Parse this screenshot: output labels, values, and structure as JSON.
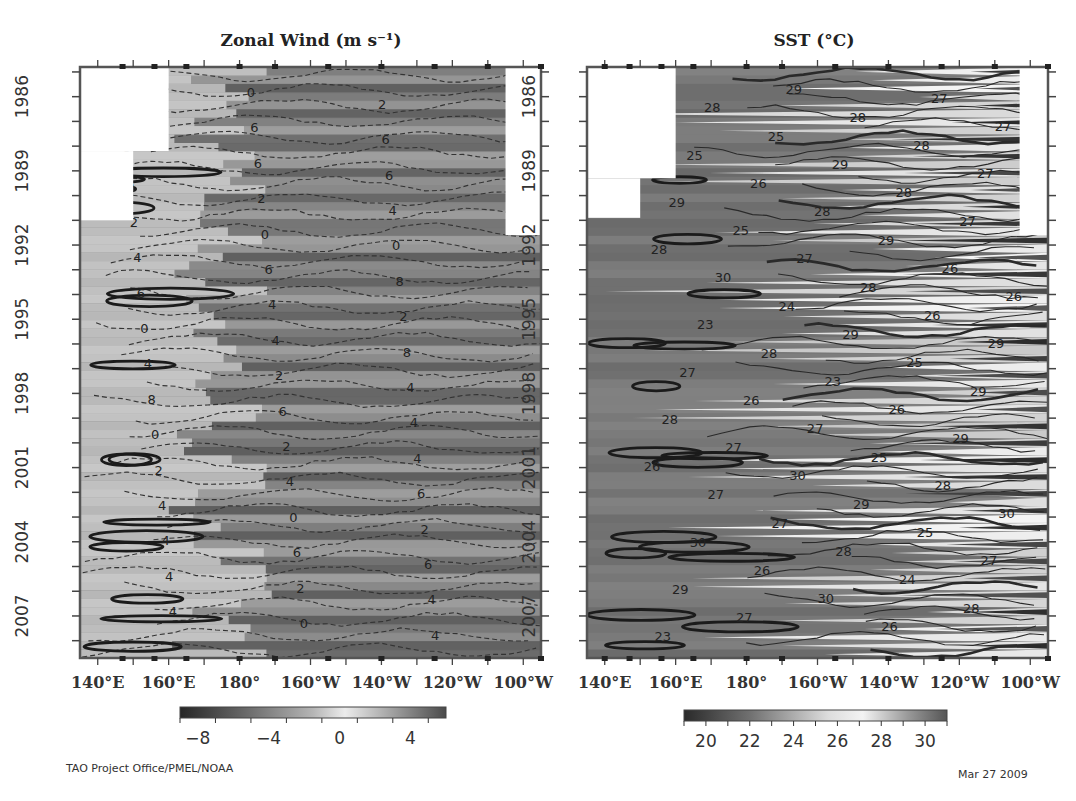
{
  "chart_data": [
    {
      "type": "heatmap",
      "title": "Zonal Wind (m s⁻¹)",
      "xlabel": "",
      "ylabel": "",
      "x_tick_labels": [
        "140°E",
        "160°E",
        "180°",
        "160°W",
        "140°W",
        "120°W",
        "100°W"
      ],
      "x_range_deg_east": [
        135,
        265
      ],
      "y_tick_labels": [
        "1986",
        "1989",
        "1992",
        "1995",
        "1998",
        "2001",
        "2004",
        "2007"
      ],
      "y_range_years": [
        1985.3,
        2009.2
      ],
      "y_direction": "increasing-downward",
      "colorbar": {
        "ticks": [
          "-8",
          "-4",
          "0",
          "4"
        ],
        "range": [
          -9,
          6
        ],
        "colormap": "grayscale (dark = strong easterly, light = weak/westerly)"
      },
      "contour_levels": [
        -8,
        -6,
        -4,
        -2,
        0,
        2,
        4
      ],
      "contour_labels_visible": [
        "4",
        "0",
        "2",
        "4",
        "6",
        "6",
        "8",
        "6",
        "6",
        "0",
        "2",
        "4",
        "2",
        "0",
        "0",
        "4",
        "6",
        "8",
        "6",
        "4",
        "2",
        "0",
        "4",
        "8",
        "4",
        "2",
        "4",
        "8",
        "6",
        "4",
        "0",
        "2",
        "4",
        "2",
        "4",
        "6",
        "4",
        "0",
        "2",
        "4",
        "6",
        "6",
        "4",
        "2",
        "4",
        "4",
        "0",
        "4"
      ],
      "missing_data_regions": [
        {
          "lon": [
            135,
            160
          ],
          "years": [
            1985.3,
            1988.7
          ]
        },
        {
          "lon": [
            135,
            150
          ],
          "years": [
            1988.7,
            1991.5
          ]
        },
        {
          "lon": [
            255,
            265
          ],
          "years": [
            1985.3,
            1992.1
          ]
        }
      ],
      "mooring_markers_lon": [
        147,
        156,
        165,
        180,
        190,
        205,
        220,
        235,
        250,
        265
      ]
    },
    {
      "type": "heatmap",
      "title": "SST (°C)",
      "xlabel": "",
      "ylabel": "",
      "x_tick_labels": [
        "140°E",
        "160°E",
        "180°",
        "160°W",
        "140°W",
        "120°W",
        "100°W"
      ],
      "x_range_deg_east": [
        135,
        265
      ],
      "y_tick_labels": [
        "1986",
        "1989",
        "1992",
        "1995",
        "1998",
        "2001",
        "2004",
        "2007"
      ],
      "y_range_years": [
        1985.3,
        2009.2
      ],
      "y_direction": "increasing-downward",
      "colorbar": {
        "ticks": [
          "20",
          "22",
          "24",
          "26",
          "28",
          "30"
        ],
        "range": [
          19,
          31
        ],
        "colormap": "grayscale (dark = cold/very warm extremes, light = mid)"
      },
      "contour_levels": [
        23,
        24,
        25,
        26,
        27,
        28,
        29,
        30
      ],
      "contour_labels_visible": [
        "28",
        "29",
        "27",
        "28",
        "28",
        "27",
        "25",
        "28",
        "25",
        "29",
        "27",
        "26",
        "28",
        "29",
        "28",
        "27",
        "25",
        "29",
        "28",
        "27",
        "26",
        "30",
        "28",
        "26",
        "24",
        "26",
        "23",
        "29",
        "29",
        "28",
        "25",
        "27",
        "23",
        "29",
        "26",
        "26",
        "28",
        "27",
        "29",
        "27",
        "25",
        "26",
        "30",
        "28",
        "27",
        "29",
        "30",
        "27",
        "25",
        "30",
        "28",
        "27",
        "26",
        "24",
        "29",
        "30",
        "28",
        "27",
        "26",
        "23"
      ],
      "missing_data_regions": [
        {
          "lon": [
            135,
            160
          ],
          "years": [
            1985.3,
            1989.8
          ]
        },
        {
          "lon": [
            135,
            150
          ],
          "years": [
            1989.8,
            1991.4
          ]
        },
        {
          "lon": [
            257,
            265
          ],
          "years": [
            1985.3,
            1992.1
          ]
        }
      ],
      "mooring_markers_lon": [
        140,
        147,
        156,
        165,
        180,
        190,
        205,
        220,
        235,
        250,
        265
      ]
    }
  ],
  "footer": {
    "credit": "TAO Project Office/PMEL/NOAA",
    "date": "Mar 27 2009"
  }
}
